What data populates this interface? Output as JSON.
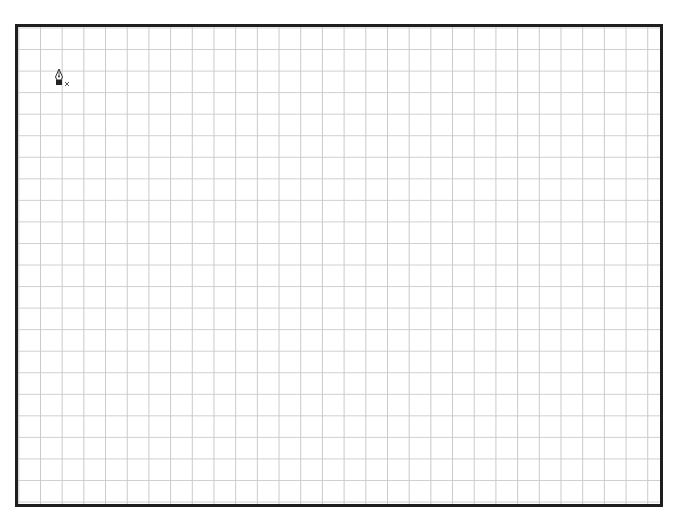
{
  "canvas": {
    "type": "grid-artboard",
    "grid": {
      "columns": 30,
      "rows": 22,
      "line_color": "#c9c9c9"
    },
    "border_color": "#1e1e1e",
    "background": "#ffffff"
  },
  "cursor": {
    "icon": "pen-tool-new-path-icon",
    "modifier_glyph": "×"
  }
}
